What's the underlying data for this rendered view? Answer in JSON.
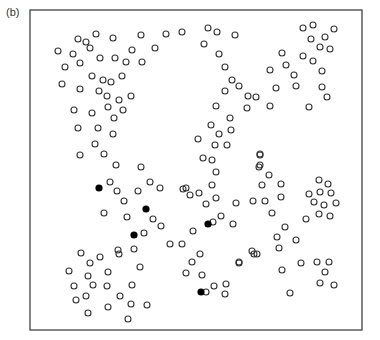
{
  "figure": {
    "panel_label": "(b)",
    "frame": {
      "x": 30,
      "y": 10,
      "width": 332,
      "height": 320,
      "stroke": "#333333"
    },
    "marker_radius": 3,
    "colors": {
      "open_stroke": "#333333",
      "filled": "#000000",
      "background": "#ffffff"
    }
  },
  "chart_data": {
    "type": "scatter",
    "title": "(b)",
    "xlabel": "",
    "ylabel": "",
    "grid": false,
    "legend": null,
    "axes_ticks": false,
    "coordinate_system": "pixel coordinates within 380x340 image",
    "series": [
      {
        "name": "open circles",
        "marker": "open-circle",
        "points": [
          [
            58,
            51
          ],
          [
            78,
            39
          ],
          [
            86,
            42
          ],
          [
            96,
            34
          ],
          [
            113,
            38
          ],
          [
            141,
            35
          ],
          [
            166,
            34
          ],
          [
            182,
            32
          ],
          [
            90,
            48
          ],
          [
            73,
            54
          ],
          [
            132,
            50
          ],
          [
            155,
            48
          ],
          [
            80,
            63
          ],
          [
            65,
            67
          ],
          [
            100,
            58
          ],
          [
            115,
            58
          ],
          [
            126,
            62
          ],
          [
            142,
            62
          ],
          [
            92,
            76
          ],
          [
            103,
            80
          ],
          [
            111,
            82
          ],
          [
            122,
            76
          ],
          [
            62,
            84
          ],
          [
            80,
            89
          ],
          [
            99,
            91
          ],
          [
            107,
            96
          ],
          [
            119,
            100
          ],
          [
            131,
            96
          ],
          [
            74,
            110
          ],
          [
            92,
            113
          ],
          [
            108,
            107
          ],
          [
            123,
            110
          ],
          [
            114,
            118
          ],
          [
            78,
            128
          ],
          [
            98,
            128
          ],
          [
            113,
            134
          ],
          [
            95,
            144
          ],
          [
            80,
            155
          ],
          [
            104,
            154
          ],
          [
            116,
            165
          ],
          [
            141,
            167
          ],
          [
            208,
            28
          ],
          [
            217,
            32
          ],
          [
            235,
            35
          ],
          [
            204,
            44
          ],
          [
            219,
            54
          ],
          [
            225,
            67
          ],
          [
            232,
            80
          ],
          [
            225,
            91
          ],
          [
            239,
            86
          ],
          [
            248,
            96
          ],
          [
            256,
            97
          ],
          [
            276,
            88
          ],
          [
            270,
            70
          ],
          [
            282,
            53
          ],
          [
            286,
            65
          ],
          [
            294,
            75
          ],
          [
            296,
            86
          ],
          [
            270,
            106
          ],
          [
            247,
            108
          ],
          [
            216,
            106
          ],
          [
            230,
            118
          ],
          [
            211,
            125
          ],
          [
            219,
            134
          ],
          [
            231,
            130
          ],
          [
            198,
            139
          ],
          [
            215,
            145
          ],
          [
            227,
            145
          ],
          [
            203,
            158
          ],
          [
            212,
            160
          ],
          [
            260,
            154
          ],
          [
            259,
            167
          ],
          [
            303,
            28
          ],
          [
            313,
            25
          ],
          [
            334,
            29
          ],
          [
            311,
            39
          ],
          [
            325,
            37
          ],
          [
            320,
            47
          ],
          [
            330,
            49
          ],
          [
            303,
            56
          ],
          [
            313,
            61
          ],
          [
            322,
            71
          ],
          [
            322,
            87
          ],
          [
            327,
            97
          ],
          [
            309,
            107
          ],
          [
            110,
            182
          ],
          [
            117,
            191
          ],
          [
            138,
            191
          ],
          [
            150,
            182
          ],
          [
            160,
            188
          ],
          [
            183,
            189
          ],
          [
            124,
            201
          ],
          [
            104,
            213
          ],
          [
            127,
            217
          ],
          [
            153,
            219
          ],
          [
            161,
            226
          ],
          [
            144,
            233
          ],
          [
            170,
            244
          ],
          [
            119,
            254
          ],
          [
            81,
            253
          ],
          [
            90,
            263
          ],
          [
            100,
            257
          ],
          [
            118,
            250
          ],
          [
            134,
            249
          ],
          [
            140,
            267
          ],
          [
            69,
            271
          ],
          [
            88,
            276
          ],
          [
            108,
            272
          ],
          [
            74,
            286
          ],
          [
            93,
            285
          ],
          [
            107,
            286
          ],
          [
            132,
            285
          ],
          [
            76,
            300
          ],
          [
            86,
            296
          ],
          [
            120,
            296
          ],
          [
            131,
            304
          ],
          [
            147,
            305
          ],
          [
            88,
            313
          ],
          [
            108,
            307
          ],
          [
            128,
            319
          ],
          [
            186,
            188
          ],
          [
            190,
            195
          ],
          [
            199,
            193
          ],
          [
            216,
            172
          ],
          [
            212,
            185
          ],
          [
            216,
            198
          ],
          [
            193,
            231
          ],
          [
            213,
            222
          ],
          [
            221,
            216
          ],
          [
            233,
            224
          ],
          [
            236,
            203
          ],
          [
            206,
            204
          ],
          [
            239,
            263
          ],
          [
            254,
            254
          ],
          [
            182,
            244
          ],
          [
            192,
            262
          ],
          [
            200,
            254
          ],
          [
            226,
            284
          ],
          [
            202,
            275
          ],
          [
            206,
            292
          ],
          [
            214,
            286
          ],
          [
            186,
            273
          ],
          [
            225,
            294
          ],
          [
            239,
            262
          ],
          [
            252,
            251
          ],
          [
            260,
            155
          ],
          [
            260,
            165
          ],
          [
            269,
            175
          ],
          [
            262,
            185
          ],
          [
            281,
            184
          ],
          [
            253,
            201
          ],
          [
            265,
            201
          ],
          [
            281,
            197
          ],
          [
            272,
            213
          ],
          [
            285,
            227
          ],
          [
            277,
            237
          ],
          [
            296,
            240
          ],
          [
            279,
            248
          ],
          [
            257,
            254
          ],
          [
            282,
            270
          ],
          [
            290,
            293
          ],
          [
            301,
            263
          ],
          [
            317,
            262
          ],
          [
            329,
            262
          ],
          [
            325,
            272
          ],
          [
            320,
            283
          ],
          [
            334,
            285
          ],
          [
            319,
            180
          ],
          [
            328,
            184
          ],
          [
            309,
            194
          ],
          [
            320,
            192
          ],
          [
            331,
            193
          ],
          [
            314,
            202
          ],
          [
            324,
            205
          ],
          [
            336,
            203
          ],
          [
            306,
            219
          ],
          [
            319,
            214
          ],
          [
            330,
            216
          ]
        ]
      },
      {
        "name": "filled circles",
        "marker": "filled-circle",
        "points": [
          [
            99,
            188
          ],
          [
            146,
            209
          ],
          [
            134,
            235
          ],
          [
            208,
            224
          ],
          [
            201,
            292
          ]
        ]
      }
    ]
  }
}
